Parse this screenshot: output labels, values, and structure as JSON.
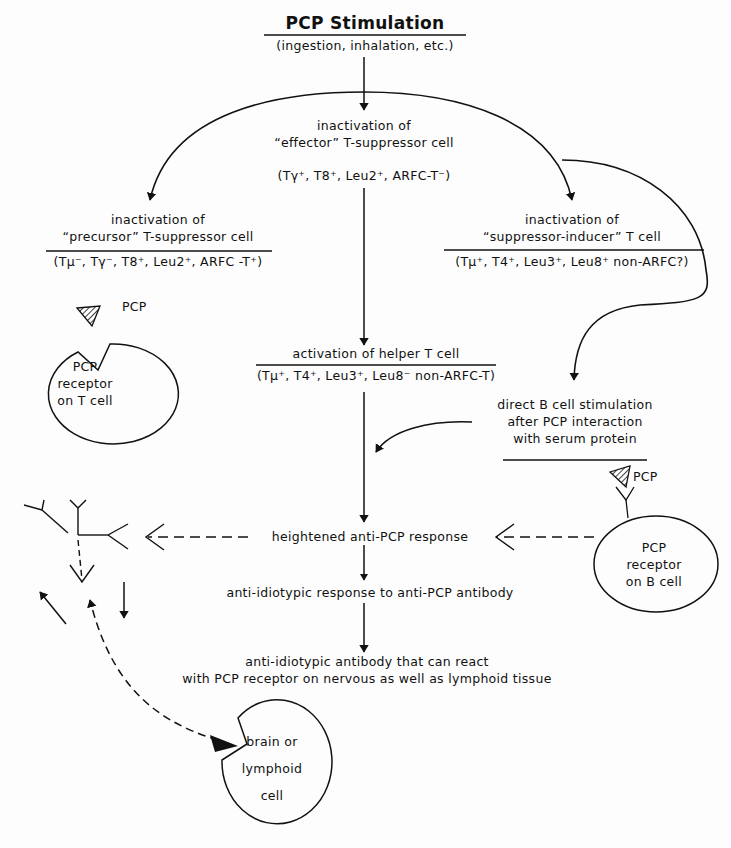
{
  "title": {
    "main": "PCP Stimulation",
    "subtitle": "(ingestion, inhalation, etc.)"
  },
  "nodes": {
    "effector": {
      "line1": "inactivation of",
      "line2": "“effector” T-suppressor cell",
      "markers": "(Tγ⁺, T8⁺, Leu2⁺, ARFC-T⁻)"
    },
    "precursor": {
      "line1": "inactivation of",
      "line2": "“precursor” T-suppressor cell",
      "markers": "(Tμ⁻, Tγ⁻, T8⁺, Leu2⁺, ARFC -T⁺)"
    },
    "suppressor_inducer": {
      "line1": "inactivation of",
      "line2": "“suppressor-inducer” T cell",
      "markers": "(Tμ⁺, T4⁺, Leu3⁺, Leu8⁺ non-ARFC?)"
    },
    "helper": {
      "line1": "activation of helper T cell",
      "markers": "(Tμ⁺, T4⁺, Leu3⁺, Leu8⁻ non-ARFC-T)"
    },
    "b_cell_stim": {
      "line1": "direct B cell stimulation",
      "line2": "after PCP interaction",
      "line3": "with serum protein"
    },
    "heightened": "heightened anti-PCP response",
    "anti_idiotypic_response": "anti-idiotypic response to anti-PCP antibody",
    "anti_idiotypic_antibody": {
      "line1": "anti-idiotypic antibody that can react",
      "line2": "with PCP receptor on nervous as well as lymphoid tissue"
    }
  },
  "cells": {
    "t_cell": {
      "ligand": "PCP",
      "line1": "PCP",
      "line2": "receptor",
      "line3": "on T cell"
    },
    "b_cell": {
      "ligand": "PCP",
      "line1": "PCP",
      "line2": "receptor",
      "line3": "on B cell"
    },
    "brain_cell": {
      "line1": "brain or",
      "line2": "lymphoid",
      "line3": "cell"
    }
  },
  "colors": {
    "ink": "#111111",
    "paper": "#fdfdfd"
  }
}
